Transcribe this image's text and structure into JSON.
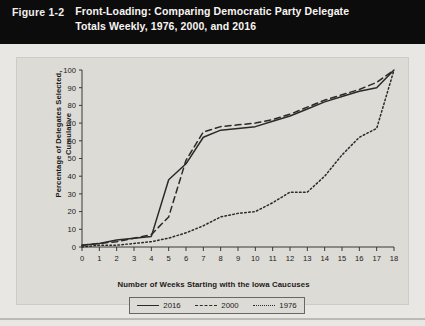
{
  "figure": {
    "number": "Figure 1-2",
    "title_line1": "Front-Loading: Comparing Democratic Party Delegate",
    "title_line2": "Totals Weekly, 1976, 2000, and 2016",
    "banner_bg": "#0d0c0c",
    "banner_fg": "#f7f5f1",
    "panel_bg": "#dddbd6"
  },
  "chart_data": {
    "type": "line",
    "title": "Front-Loading: Comparing Democratic Party Delegate Totals Weekly, 1976, 2000, and 2016",
    "xlabel": "Number of Weeks Starting with the Iowa Caucuses",
    "ylabel": "Percentage of Delegates Selected, Cumulative",
    "xlim": [
      0,
      18
    ],
    "ylim": [
      0,
      100
    ],
    "xticks": [
      0,
      1,
      2,
      3,
      4,
      5,
      6,
      7,
      8,
      9,
      10,
      11,
      12,
      13,
      14,
      15,
      16,
      17,
      18
    ],
    "yticks": [
      0,
      10,
      20,
      30,
      40,
      50,
      60,
      70,
      80,
      90,
      100
    ],
    "xtick_labels": [
      "0",
      "1",
      "2",
      "3",
      "4",
      "5",
      "6",
      "7",
      "8",
      "9",
      "10",
      "11",
      "12",
      "13",
      "14",
      "15",
      "16",
      "17",
      "18"
    ],
    "ytick_labels": [
      "0",
      "10",
      "20",
      "30",
      "40",
      "50",
      "60",
      "70",
      "80",
      "90",
      "100"
    ],
    "grid": false,
    "legend_position": "below-axes",
    "x": [
      0,
      1,
      2,
      3,
      4,
      5,
      6,
      7,
      8,
      9,
      10,
      11,
      12,
      13,
      14,
      15,
      16,
      17,
      18
    ],
    "series": [
      {
        "name": "2016",
        "style": "solid",
        "color": "#2b2a28",
        "values": [
          1,
          2,
          4,
          5,
          6,
          38,
          47,
          62,
          66,
          67,
          68,
          71,
          74,
          78,
          82,
          85,
          88,
          90,
          100
        ]
      },
      {
        "name": "2000",
        "style": "dashed",
        "color": "#2b2a28",
        "values": [
          1,
          2,
          3,
          5,
          7,
          17,
          49,
          65,
          68,
          69,
          70,
          72,
          75,
          79,
          83,
          86,
          89,
          93,
          100
        ]
      },
      {
        "name": "1976",
        "style": "dotted",
        "color": "#2b2a28",
        "values": [
          0,
          1,
          1,
          2,
          3,
          5,
          8,
          12,
          17,
          19,
          20,
          25,
          31,
          31,
          40,
          52,
          62,
          67,
          100
        ]
      }
    ]
  },
  "legend": {
    "items": [
      {
        "label": "2016",
        "style": "solid"
      },
      {
        "label": "2000",
        "style": "dashed"
      },
      {
        "label": "1976",
        "style": "dotted"
      }
    ]
  }
}
